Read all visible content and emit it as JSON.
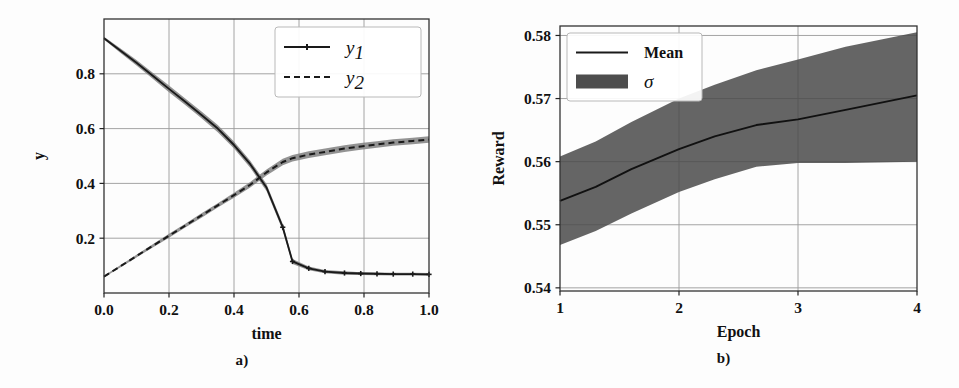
{
  "figure": {
    "background": "#fdfdfd",
    "panels": [
      {
        "caption": "a)"
      },
      {
        "caption": "b)"
      }
    ]
  },
  "chart_data": [
    {
      "type": "line",
      "panel": "a",
      "title": "",
      "xlabel": "time",
      "ylabel": "y",
      "xlim": [
        0.0,
        1.0
      ],
      "ylim": [
        0.0,
        1.0
      ],
      "xticks": [
        0.0,
        0.2,
        0.4,
        0.6,
        0.8,
        1.0
      ],
      "xticklabels": [
        "0.0",
        "0.2",
        "0.4",
        "0.6",
        "0.8",
        "1.0"
      ],
      "yticks": [
        0.2,
        0.4,
        0.6,
        0.8
      ],
      "yticklabels": [
        "0.2",
        "0.4",
        "0.6",
        "0.8"
      ],
      "grid": true,
      "legend": {
        "position": "upper right",
        "entries": [
          {
            "label": "y",
            "sub": "1",
            "style": "solid-with-marker",
            "color": "#1a1a1a"
          },
          {
            "label": "y",
            "sub": "2",
            "style": "dashed",
            "color": "#1a1a1a"
          }
        ]
      },
      "x": [
        0.0,
        0.05,
        0.1,
        0.15,
        0.2,
        0.25,
        0.3,
        0.35,
        0.4,
        0.45,
        0.5,
        0.55,
        0.58,
        0.63,
        0.68,
        0.74,
        0.79,
        0.84,
        0.89,
        0.95,
        1.0
      ],
      "series": [
        {
          "name": "y1",
          "style": "solid",
          "marker": "plus",
          "color": "#1a1a1a",
          "band_color": "#808080",
          "values": [
            0.93,
            0.885,
            0.84,
            0.793,
            0.745,
            0.698,
            0.65,
            0.6,
            0.54,
            0.47,
            0.385,
            0.24,
            0.115,
            0.09,
            0.078,
            0.073,
            0.071,
            0.07,
            0.069,
            0.069,
            0.068
          ],
          "band_upper": [
            0.935,
            0.893,
            0.85,
            0.804,
            0.757,
            0.71,
            0.662,
            0.613,
            0.553,
            0.483,
            0.398,
            0.252,
            0.124,
            0.097,
            0.084,
            0.079,
            0.076,
            0.075,
            0.074,
            0.074,
            0.073
          ],
          "band_lower": [
            0.925,
            0.877,
            0.83,
            0.782,
            0.733,
            0.686,
            0.638,
            0.587,
            0.527,
            0.457,
            0.372,
            0.228,
            0.106,
            0.083,
            0.072,
            0.067,
            0.066,
            0.065,
            0.064,
            0.064,
            0.063
          ]
        },
        {
          "name": "y2",
          "style": "dashed",
          "color": "#1a1a1a",
          "band_color": "#808080",
          "values": [
            0.06,
            0.097,
            0.135,
            0.172,
            0.209,
            0.246,
            0.283,
            0.32,
            0.357,
            0.395,
            0.44,
            0.478,
            0.492,
            0.505,
            0.515,
            0.527,
            0.535,
            0.542,
            0.549,
            0.555,
            0.56
          ],
          "band_upper": [
            0.063,
            0.101,
            0.14,
            0.178,
            0.216,
            0.253,
            0.291,
            0.328,
            0.366,
            0.405,
            0.451,
            0.49,
            0.504,
            0.517,
            0.527,
            0.539,
            0.547,
            0.554,
            0.561,
            0.567,
            0.572
          ],
          "band_lower": [
            0.057,
            0.093,
            0.13,
            0.166,
            0.202,
            0.239,
            0.275,
            0.312,
            0.348,
            0.385,
            0.429,
            0.466,
            0.48,
            0.493,
            0.503,
            0.515,
            0.523,
            0.53,
            0.537,
            0.543,
            0.548
          ]
        }
      ]
    },
    {
      "type": "line",
      "panel": "b",
      "title": "",
      "xlabel": "Epoch",
      "ylabel": "Reward",
      "xlim": [
        1,
        4
      ],
      "ylim": [
        0.5395,
        0.5815
      ],
      "xticks": [
        1,
        2,
        3,
        4
      ],
      "xticklabels": [
        "1",
        "2",
        "3",
        "4"
      ],
      "yticks": [
        0.54,
        0.55,
        0.56,
        0.57,
        0.58
      ],
      "yticklabels": [
        "0.54",
        "0.55",
        "0.56",
        "0.57",
        "0.58"
      ],
      "grid": true,
      "legend": {
        "position": "upper left",
        "entries": [
          {
            "label": "Mean",
            "style": "solid",
            "color": "#1a1a1a"
          },
          {
            "label": "σ",
            "style": "patch",
            "color": "#4d4d4d"
          }
        ]
      },
      "x": [
        1.0,
        1.3,
        1.6,
        2.0,
        2.3,
        2.65,
        3.0,
        3.4,
        4.0
      ],
      "series": [
        {
          "name": "Mean",
          "style": "solid",
          "color": "#111111",
          "values": [
            0.5538,
            0.556,
            0.5588,
            0.562,
            0.564,
            0.5658,
            0.5667,
            0.5682,
            0.5705
          ],
          "band_upper": [
            0.5608,
            0.5632,
            0.5663,
            0.57,
            0.5722,
            0.5745,
            0.5762,
            0.5782,
            0.5805
          ],
          "band_lower": [
            0.5468,
            0.549,
            0.5518,
            0.5552,
            0.5572,
            0.5592,
            0.5598,
            0.5598,
            0.56
          ],
          "band_color": "#4a4a4a"
        }
      ]
    }
  ]
}
